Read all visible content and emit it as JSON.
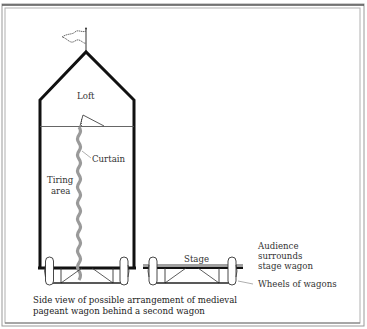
{
  "figure": {
    "type": "diagram"
  },
  "labels": {
    "loft": "Loft",
    "curtain": "Curtain",
    "tiring_area_line1": "Tiring",
    "tiring_area_line2": "area",
    "stage": "Stage",
    "audience_line1": "Audience",
    "audience_line2": "surrounds",
    "audience_line3": "stage wagon",
    "wheels": "Wheels of wagons"
  },
  "caption": {
    "line1": "Side view of possible arrangement of medieval",
    "line2": "pageant wagon behind a second wagon"
  },
  "colors": {
    "outline": "#111111",
    "curtain": "#9a9a9a",
    "stage_top": "#a0a0a0",
    "frame": "#888888",
    "text": "#333333"
  }
}
